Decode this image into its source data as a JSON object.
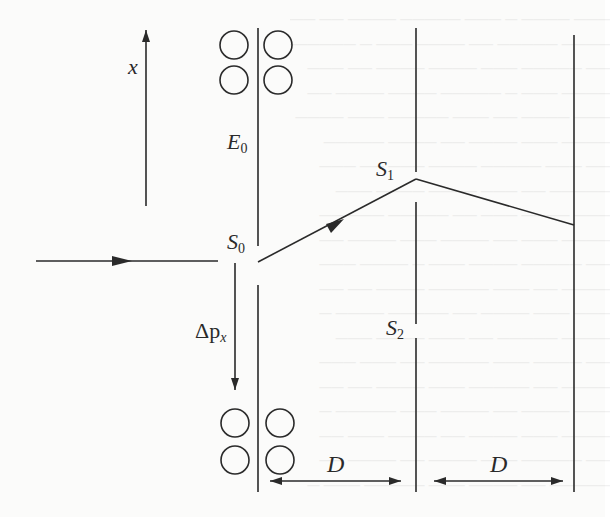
{
  "figure": {
    "labels": {
      "x_axis": "x",
      "e0": "E",
      "e0_sub": "0",
      "s0": "S",
      "s0_sub": "0",
      "s1": "S",
      "s1_sub": "1",
      "s2": "S",
      "s2_sub": "2",
      "dp": "Δp",
      "dp_sub": "x",
      "d_left": "D",
      "d_right": "D"
    },
    "colors": {
      "ink": "#2a2a2a",
      "background": "#fbfbfa"
    },
    "elements": {
      "screens": [
        {
          "name": "first-screen",
          "x": 258,
          "segments": [
            [
              28,
              246
            ],
            [
              285,
              492
            ]
          ]
        },
        {
          "name": "double-slit-screen",
          "x": 416,
          "segments": [
            [
              28,
              172
            ],
            [
              202,
              324
            ],
            [
              338,
              492
            ]
          ]
        },
        {
          "name": "detection-screen",
          "x": 574,
          "segments": [
            [
              35,
              492
            ]
          ]
        }
      ],
      "cavities_top": [
        [
          234,
          45
        ],
        [
          278,
          45
        ],
        [
          234,
          80
        ],
        [
          278,
          80
        ]
      ],
      "cavities_bottom": [
        [
          235,
          423
        ],
        [
          280,
          423
        ],
        [
          235,
          460
        ],
        [
          280,
          460
        ]
      ],
      "incident_beam": {
        "from": [
          36,
          261
        ],
        "to": [
          218,
          261
        ]
      },
      "ray_s0_s1": {
        "from": [
          258,
          262
        ],
        "to": [
          416,
          179
        ]
      },
      "ray_s1_screen": {
        "from": [
          416,
          179
        ],
        "to": [
          574,
          225
        ]
      },
      "x_axis_arrow": {
        "from": [
          146,
          206
        ],
        "to": [
          146,
          30
        ]
      },
      "momentum_kick_arrow": {
        "from": [
          235,
          263
        ],
        "to": [
          235,
          390
        ]
      },
      "distance_markers": [
        {
          "from": 270,
          "to": 401,
          "y": 481
        },
        {
          "from": 434,
          "to": 563,
          "y": 481
        }
      ]
    }
  }
}
